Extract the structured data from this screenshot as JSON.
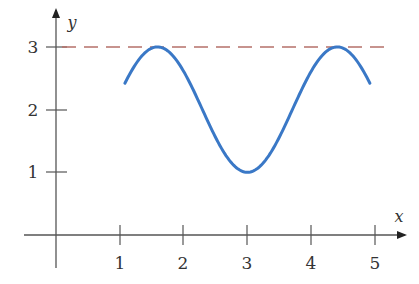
{
  "chart_data": {
    "type": "line",
    "title": "",
    "xlabel": "x",
    "ylabel": "y",
    "x_ticks": [
      "1",
      "2",
      "3",
      "4",
      "5"
    ],
    "y_ticks": [
      "1",
      "2",
      "3"
    ],
    "xlim": [
      -0.5,
      5.5
    ],
    "ylim": [
      -0.5,
      3.4
    ],
    "grid": false,
    "legend": null,
    "series": [
      {
        "name": "curve",
        "color": "#3a78c6",
        "style": "solid",
        "x": [
          1.08,
          1.2,
          1.4,
          1.59,
          1.8,
          2.0,
          2.2,
          2.4,
          2.6,
          2.8,
          3.0,
          3.2,
          3.4,
          3.6,
          3.8,
          4.0,
          4.2,
          4.41,
          4.6,
          4.8,
          4.92
        ],
        "y": [
          1.72,
          2.28,
          2.82,
          3.0,
          2.89,
          2.6,
          2.2,
          1.78,
          1.4,
          1.1,
          1.0,
          1.1,
          1.4,
          1.78,
          2.2,
          2.6,
          2.89,
          3.0,
          2.82,
          2.28,
          1.72
        ]
      },
      {
        "name": "y = 3",
        "color": "#b5706a",
        "style": "dashed",
        "x": [
          0,
          5.15
        ],
        "y": [
          3,
          3
        ]
      }
    ],
    "annotations": [
      {
        "text": "maximum at y = 3",
        "x": 1.59
      },
      {
        "text": "maximum at y = 3",
        "x": 4.41
      },
      {
        "text": "minimum at y = 1",
        "x": 3.0
      }
    ]
  }
}
